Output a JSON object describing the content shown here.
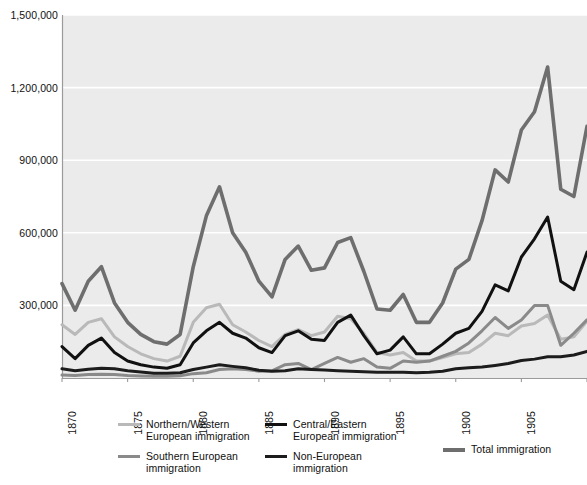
{
  "chart_data": {
    "type": "line",
    "title": "",
    "subtitle": "",
    "xlabel": "",
    "ylabel": "",
    "xlim": [
      1870,
      1910
    ],
    "ylim": [
      0,
      1500000
    ],
    "grid": true,
    "grid_axis": "y",
    "legend_position": "bottom",
    "y_ticks": [
      0,
      300000,
      600000,
      900000,
      1200000,
      1500000
    ],
    "y_tick_labels": [
      "0",
      "300,000",
      "600,000",
      "900,000",
      "1,200,000",
      "1,500,000"
    ],
    "y_tick_labels_visible": [
      "300,000",
      "600,000",
      "900,000",
      "1,200,000",
      "1,500,000"
    ],
    "x_ticks": [
      1870,
      1875,
      1880,
      1885,
      1890,
      1895,
      1900,
      1905,
      1910
    ],
    "x_tick_labels": [
      "1870",
      "1875",
      "1880",
      "1885",
      "1890",
      "1895",
      "1900",
      "1905",
      "1910"
    ],
    "x": [
      1870,
      1871,
      1872,
      1873,
      1874,
      1875,
      1876,
      1877,
      1878,
      1879,
      1880,
      1881,
      1882,
      1883,
      1884,
      1885,
      1886,
      1887,
      1888,
      1889,
      1890,
      1891,
      1892,
      1893,
      1894,
      1895,
      1896,
      1897,
      1898,
      1899,
      1900,
      1901,
      1902,
      1903,
      1904,
      1905,
      1906,
      1907,
      1908,
      1909,
      1910
    ],
    "series": [
      {
        "name": "Total immigration",
        "key": "total",
        "color": "#6e6e6e",
        "width": 3.6,
        "values": [
          390000,
          280000,
          400000,
          460000,
          310000,
          230000,
          180000,
          150000,
          140000,
          180000,
          460000,
          670000,
          790000,
          600000,
          520000,
          400000,
          335000,
          490000,
          545000,
          445000,
          455000,
          560000,
          580000,
          440000,
          285000,
          280000,
          345000,
          230000,
          230000,
          310000,
          450000,
          490000,
          650000,
          860000,
          810000,
          1025000,
          1100000,
          1285000,
          780000,
          750000,
          1040000
        ]
      },
      {
        "name": "Northern/Western European immigration",
        "key": "northern_western",
        "color": "#b9b9b9",
        "width": 3.0,
        "values": [
          220000,
          180000,
          230000,
          245000,
          170000,
          130000,
          100000,
          80000,
          70000,
          90000,
          230000,
          290000,
          305000,
          220000,
          190000,
          155000,
          130000,
          180000,
          200000,
          175000,
          190000,
          255000,
          245000,
          185000,
          105000,
          95000,
          105000,
          70000,
          70000,
          85000,
          100000,
          105000,
          140000,
          185000,
          175000,
          215000,
          225000,
          260000,
          160000,
          170000,
          235000
        ]
      },
      {
        "name": "Southern European immigration",
        "key": "southern",
        "color": "#8a8a8a",
        "width": 3.0,
        "values": [
          12000,
          10000,
          14000,
          16000,
          14000,
          10000,
          8000,
          7000,
          7000,
          9000,
          18000,
          22000,
          35000,
          38000,
          35000,
          28000,
          30000,
          55000,
          60000,
          35000,
          60000,
          85000,
          65000,
          80000,
          45000,
          40000,
          70000,
          65000,
          70000,
          90000,
          110000,
          145000,
          195000,
          250000,
          205000,
          240000,
          300000,
          300000,
          135000,
          185000,
          240000
        ]
      },
      {
        "name": "Central/Eastern European immigration",
        "key": "central_eastern",
        "color": "#111111",
        "width": 3.0,
        "values": [
          130000,
          80000,
          135000,
          165000,
          105000,
          70000,
          55000,
          45000,
          40000,
          55000,
          145000,
          195000,
          230000,
          185000,
          165000,
          125000,
          105000,
          175000,
          195000,
          160000,
          155000,
          230000,
          260000,
          175000,
          100000,
          115000,
          170000,
          100000,
          100000,
          140000,
          185000,
          205000,
          275000,
          385000,
          360000,
          500000,
          575000,
          665000,
          400000,
          365000,
          520000
        ]
      },
      {
        "name": "Non-European immigration",
        "key": "non_european",
        "color": "#1c1c1c",
        "width": 3.0,
        "values": [
          38000,
          30000,
          36000,
          40000,
          38000,
          30000,
          25000,
          20000,
          20000,
          22000,
          35000,
          45000,
          55000,
          48000,
          42000,
          32000,
          28000,
          30000,
          38000,
          35000,
          33000,
          30000,
          28000,
          26000,
          24000,
          24000,
          24000,
          22000,
          24000,
          28000,
          38000,
          42000,
          45000,
          52000,
          60000,
          72000,
          78000,
          88000,
          88000,
          95000,
          110000
        ]
      }
    ]
  },
  "y_axis": {
    "name": "y-axis",
    "ticks": [
      {
        "label": "1,500,000",
        "value": 1500000
      },
      {
        "label": "1,200,000",
        "value": 1200000
      },
      {
        "label": "900,000",
        "value": 900000
      },
      {
        "label": "600,000",
        "value": 600000
      },
      {
        "label": "300,000",
        "value": 300000
      }
    ]
  },
  "x_axis": {
    "name": "x-axis",
    "ticks": [
      {
        "label": "1870",
        "value": 1870
      },
      {
        "label": "1875",
        "value": 1875
      },
      {
        "label": "1880",
        "value": 1880
      },
      {
        "label": "1885",
        "value": 1885
      },
      {
        "label": "1890",
        "value": 1890
      },
      {
        "label": "1895",
        "value": 1895
      },
      {
        "label": "1900",
        "value": 1900
      },
      {
        "label": "1905",
        "value": 1905
      },
      {
        "label": "1910",
        "value": 1910
      }
    ]
  },
  "legend": {
    "entries": [
      {
        "label": "Northern/Western\nEuropean immigration",
        "key": "northern_western",
        "color": "#b9b9b9",
        "thickness": 3,
        "col": 0,
        "row": 0
      },
      {
        "label": "Southern European\nimmigration",
        "key": "southern",
        "color": "#8a8a8a",
        "thickness": 3,
        "col": 0,
        "row": 1
      },
      {
        "label": "Central/Eastern\nEuropean immigration",
        "key": "central_eastern",
        "color": "#111111",
        "thickness": 3,
        "col": 1,
        "row": 0
      },
      {
        "label": "Non-European\nimmigration",
        "key": "non_european",
        "color": "#1c1c1c",
        "thickness": 3,
        "col": 1,
        "row": 1
      },
      {
        "label": "Total immigration",
        "key": "total",
        "color": "#6e6e6e",
        "thickness": 4,
        "col": 2,
        "row": 0
      }
    ]
  },
  "colors": {
    "plot_background": "#ebebeb",
    "page_background": "#ffffff",
    "gridline": "#ffffff",
    "axis_line": "#9a9a9a",
    "text": "#111111"
  }
}
